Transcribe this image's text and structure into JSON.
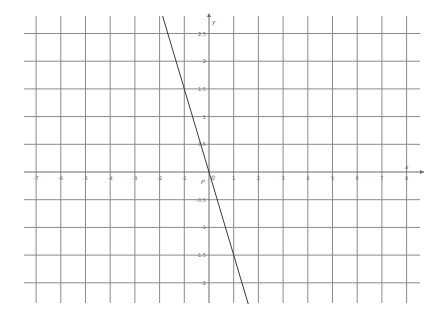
{
  "chart_data": {
    "type": "line",
    "title": "",
    "xlabel": "x",
    "ylabel": "y",
    "origin_label": "0",
    "point_label": "P",
    "xlim": [
      -7.4,
      8.5
    ],
    "ylim": [
      -2.3,
      2.8
    ],
    "x_ticks": [
      -7,
      -6,
      -5,
      -4,
      -3,
      -2,
      -1,
      0,
      1,
      2,
      3,
      4,
      5,
      6,
      7,
      8
    ],
    "y_ticks": [
      -2,
      -1.5,
      -1,
      -0.5,
      0.5,
      1,
      1.5,
      2,
      2.5
    ],
    "x_tick_labels": [
      "-7",
      "-6",
      "-5",
      "-4",
      "-3",
      "-2",
      "-1",
      "0",
      "1",
      "2",
      "3",
      "4",
      "5",
      "6",
      "7",
      "8"
    ],
    "y_tick_labels": [
      "-2",
      "-1,5",
      "-1",
      "-0,5",
      "0,5",
      "1",
      "1,5",
      "2",
      "2,5"
    ],
    "grid": true,
    "legend": null,
    "series": [
      {
        "name": "y = -1.5x",
        "equation": "y = -1.5x",
        "x": [
          -2.0,
          -1.0,
          0,
          1.0,
          1.5
        ],
        "values": [
          3.0,
          1.5,
          0,
          -1.5,
          -2.25
        ]
      }
    ]
  },
  "labels": {
    "x_axis": "x",
    "y_axis": "y",
    "origin": "0",
    "point": "P"
  }
}
